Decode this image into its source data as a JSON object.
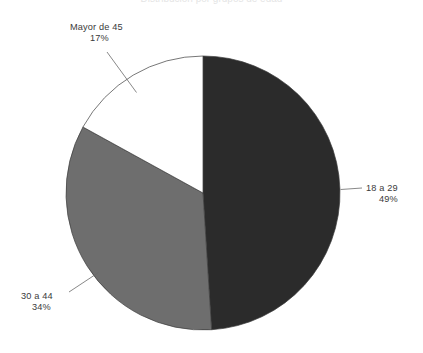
{
  "page": {
    "background_color": "#ffffff",
    "width": 423,
    "height": 353
  },
  "title": {
    "text": "Distribución por grupos de edad",
    "clipped": "true"
  },
  "labels": {
    "slice_18_29": {
      "name": "18 a 29",
      "percent": "49%"
    },
    "slice_30_44": {
      "name": "30 a 44",
      "percent": "34%"
    },
    "slice_mayor_45": {
      "name": "Mayor de 45",
      "percent": "17%"
    }
  },
  "colors": {
    "slice_18_29": "#2b2b2b",
    "slice_30_44": "#6e6e6e",
    "slice_mayor_45": "#ffffff",
    "slice_border": "#3c3c3c",
    "leader_line": "#6a6a6a",
    "text": "#3a3a3a",
    "background": "#ffffff"
  },
  "geometry": {
    "center_x": 203,
    "center_y": 193,
    "radius": 137
  },
  "chart_data": {
    "type": "pie",
    "title": "Distribución por grupos de edad",
    "categories": [
      "18 a 29",
      "30 a 44",
      "Mayor de 45"
    ],
    "values": [
      49,
      34,
      17
    ],
    "value_unit": "percent",
    "data_labels": [
      "49%",
      "34%",
      "17%"
    ],
    "colors": [
      "#2b2b2b",
      "#6e6e6e",
      "#ffffff"
    ],
    "legend": "none",
    "label_position": "outside-with-leader-lines",
    "start_angle_deg": 0,
    "direction": "clockwise",
    "grid": "off",
    "xlabel": "",
    "ylabel": ""
  }
}
